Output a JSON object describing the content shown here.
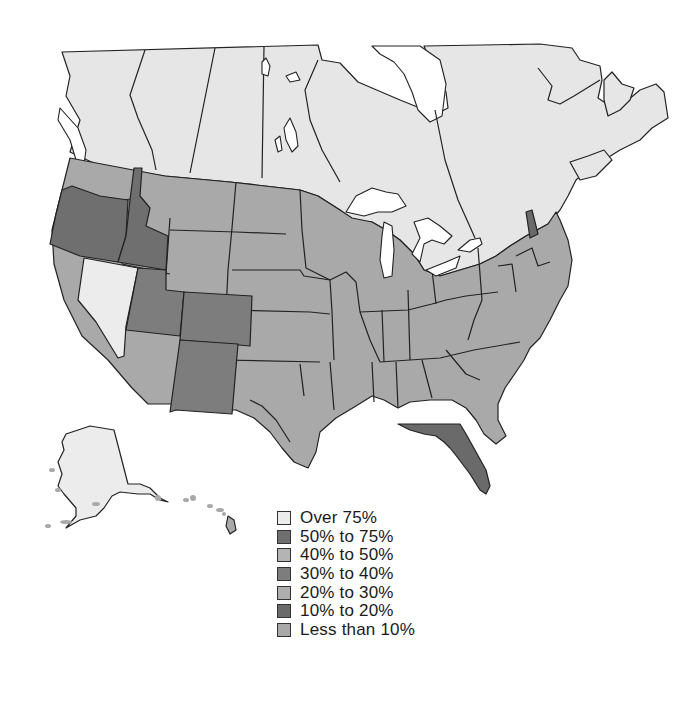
{
  "map": {
    "title": "",
    "colors": {
      "over_75": "#ececec",
      "50_75": "#6f6f6f",
      "40_50": "#b4b4b4",
      "30_40": "#7d7d7d",
      "20_30": "#aeaeae",
      "10_20": "#6a6a6a",
      "less_10": "#a9a9a9",
      "canada": "#e6e6e6",
      "border": "#222222"
    },
    "regions": [
      {
        "name": "Canada",
        "category": "canada"
      },
      {
        "name": "Nevada",
        "category": "over_75"
      },
      {
        "name": "Alaska",
        "category": "over_75"
      },
      {
        "name": "Oregon",
        "category": "50_75"
      },
      {
        "name": "Idaho",
        "category": "50_75"
      },
      {
        "name": "Utah",
        "category": "30_40"
      },
      {
        "name": "Colorado",
        "category": "30_40"
      },
      {
        "name": "New Mexico",
        "category": "30_40"
      },
      {
        "name": "Florida",
        "category": "10_20"
      },
      {
        "name": "New Hampshire",
        "category": "10_20"
      },
      {
        "name": "Other states",
        "category": "less_10"
      }
    ]
  },
  "legend": {
    "items": [
      {
        "label": "Over 75%",
        "color": "#ececec"
      },
      {
        "label": "50% to 75%",
        "color": "#6f6f6f"
      },
      {
        "label": "40% to 50%",
        "color": "#b4b4b4"
      },
      {
        "label": "30% to 40%",
        "color": "#7d7d7d"
      },
      {
        "label": "20% to 30%",
        "color": "#aeaeae"
      },
      {
        "label": "10% to 20%",
        "color": "#6a6a6a"
      },
      {
        "label": "Less than 10%",
        "color": "#a9a9a9"
      }
    ]
  }
}
